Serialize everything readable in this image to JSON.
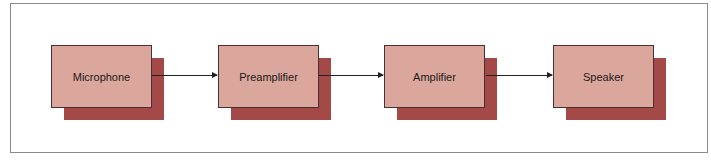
{
  "diagram": {
    "type": "signal-chain-block-diagram",
    "colors": {
      "box_fill": "#dba69c",
      "box_shadow": "#a34a48",
      "border": "#4a3030",
      "arrow": "#222222"
    },
    "blocks": [
      {
        "label": "Microphone"
      },
      {
        "label": "Preamplifier"
      },
      {
        "label": "Amplifier"
      },
      {
        "label": "Speaker"
      }
    ],
    "connections": [
      {
        "from": "Microphone",
        "to": "Preamplifier"
      },
      {
        "from": "Preamplifier",
        "to": "Amplifier"
      },
      {
        "from": "Amplifier",
        "to": "Speaker"
      }
    ]
  }
}
